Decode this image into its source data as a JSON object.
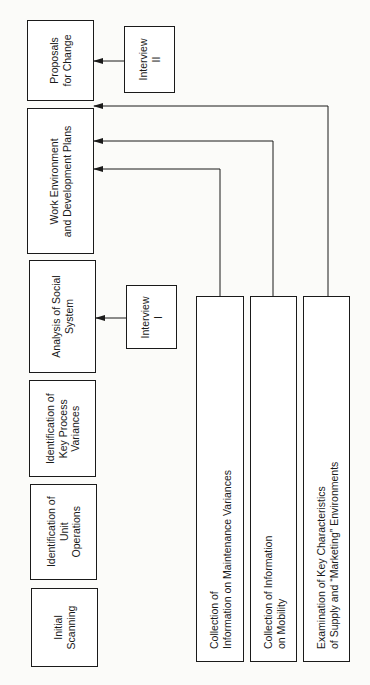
{
  "diagram": {
    "orientation": "rotated 90° counter-clockwise",
    "main_sequence": [
      {
        "id": "initial",
        "label": "Initial\nScanning"
      },
      {
        "id": "unit-ops",
        "label": "Identification of\nUnit\nOperations"
      },
      {
        "id": "key-variances",
        "label": "Identification of\nKey Process\nVariances"
      },
      {
        "id": "social",
        "label": "Analysis of Social\nSystem"
      },
      {
        "id": "work-env",
        "label": "Work Environment\nand Development Plans"
      },
      {
        "id": "proposals",
        "label": "Proposals\nfor Change"
      }
    ],
    "interviews": [
      {
        "id": "interview-1",
        "label": "Interview\nI",
        "feeds": "social"
      },
      {
        "id": "interview-2",
        "label": "Interview\nII",
        "feeds": "proposals"
      }
    ],
    "inputs": [
      {
        "id": "maintenance",
        "label": "Collection of\nInformation on Maintenance Variances",
        "feeds": "work-env"
      },
      {
        "id": "mobility",
        "label": "Collection of Information\non Mobility",
        "feeds": "work-env"
      },
      {
        "id": "environments",
        "label": "Examination of Key Characteristics\nof Supply and “Marketing” Environments",
        "feeds": "work-env"
      }
    ],
    "colors": {
      "line": "#1a1a1a",
      "background": "#fbfbf9"
    }
  }
}
